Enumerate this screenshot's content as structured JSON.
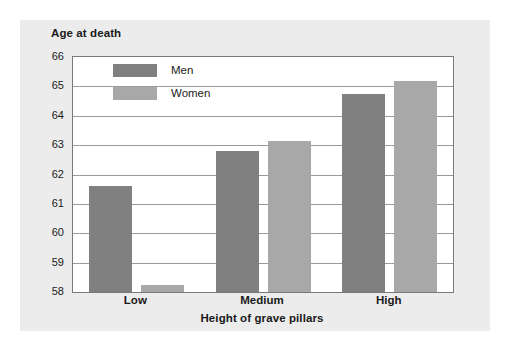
{
  "chart_data": {
    "type": "bar",
    "title": "",
    "xlabel": "Height of grave pillars",
    "ylabel": "Age at death",
    "categories": [
      "Low",
      "Medium",
      "High"
    ],
    "series": [
      {
        "name": "Men",
        "values": [
          61.6,
          62.8,
          64.75
        ],
        "color": "#808080"
      },
      {
        "name": "Women",
        "values": [
          58.25,
          63.15,
          65.2
        ],
        "color": "#a8a8a8"
      }
    ],
    "ylim": [
      58,
      66
    ],
    "yticks": [
      58,
      59,
      60,
      61,
      62,
      63,
      64,
      65,
      66
    ],
    "ytick_labels": [
      "58",
      "59",
      "60",
      "61",
      "62",
      "63",
      "64",
      "65",
      "66"
    ],
    "grid": true,
    "legend_position": "upper-left-inside",
    "panel_background": "#ececec",
    "plot_background": "#ffffff",
    "gridline_color": "#9a9a9a",
    "axis_color": "#7a7a7a"
  }
}
